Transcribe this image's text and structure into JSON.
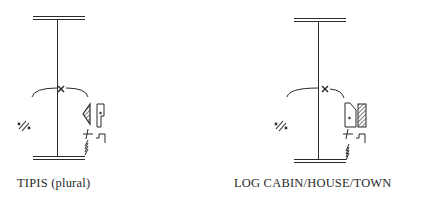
{
  "figures": [
    {
      "id": "tipis",
      "caption": "TIPIS (plural)",
      "symbols": [
        "top-double-bar",
        "vertical-stem",
        "arc-with-x-mark",
        "dotted-slash-mark",
        "hatched-triangle",
        "flag-rectangle",
        "cross-tick",
        "step-mark",
        "hatched-base"
      ]
    },
    {
      "id": "log-cabin",
      "caption": "LOG CABIN/HOUSE/TOWN",
      "symbols": [
        "top-double-bar",
        "vertical-stem",
        "arc-with-x-mark",
        "dotted-slash-mark",
        "slanted-rectangle-with-dot",
        "hatched-rectangle",
        "cross-tick",
        "step-mark",
        "hatched-base"
      ]
    }
  ],
  "colors": {
    "ink": "#2a2a2a",
    "background": "#ffffff"
  }
}
